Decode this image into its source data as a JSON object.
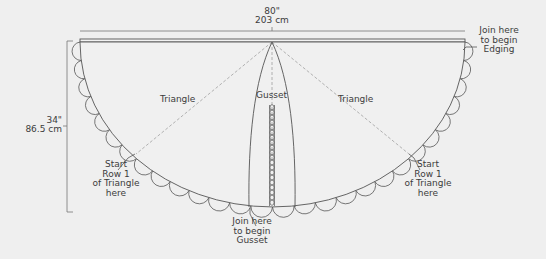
{
  "diagram": {
    "type": "crochet-shawl-schematic",
    "colors": {
      "background": "#efefef",
      "line": "#555555",
      "dashed": "#9a9a9a",
      "text": "#3c3c3c"
    },
    "width_dimension": {
      "imperial": "80\"",
      "metric": "203 cm"
    },
    "height_dimension": {
      "imperial": "34\"",
      "metric": "86.5 cm"
    },
    "sections": {
      "triangle_left": "Triangle",
      "gusset": "Gusset",
      "triangle_right": "Triangle"
    },
    "callouts": {
      "edging": [
        "Join here",
        "to begin",
        "Edging"
      ],
      "gusset_join": [
        "Join here",
        "to begin",
        "Gusset"
      ],
      "start_left": [
        "Start",
        "Row 1",
        "of Triangle",
        "here"
      ],
      "start_right": [
        "Start",
        "Row 1",
        "of Triangle",
        "here"
      ]
    }
  }
}
